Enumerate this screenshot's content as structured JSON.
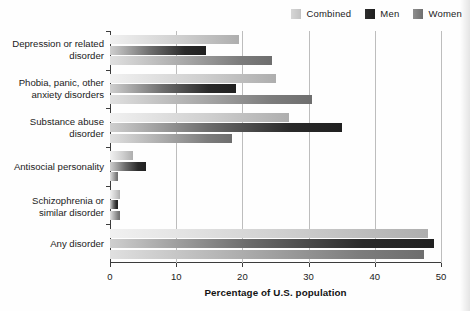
{
  "chart_data": {
    "type": "bar",
    "orientation": "horizontal",
    "title": "",
    "xlabel": "Percentage of U.S. population",
    "ylabel": "",
    "xlim": [
      0,
      50
    ],
    "xticks": [
      0,
      10,
      20,
      30,
      40,
      50
    ],
    "grid": "vertical",
    "legend_position": "top-right",
    "categories": [
      "Depression or related disorder",
      "Phobia, panic, other anxiety disorders",
      "Substance abuse disorder",
      "Antisocial personality",
      "Schizophrenia or similar disorder",
      "Any disorder"
    ],
    "series": [
      {
        "name": "Combined",
        "color": "#cfcfcf",
        "values": [
          19.5,
          25.0,
          27.0,
          3.5,
          1.5,
          48.0
        ]
      },
      {
        "name": "Men",
        "color": "#232323",
        "values": [
          14.5,
          19.0,
          35.0,
          5.5,
          1.2,
          49.0
        ]
      },
      {
        "name": "Women",
        "color": "#7e7e7e",
        "values": [
          24.5,
          30.5,
          18.5,
          1.2,
          1.5,
          47.5
        ]
      }
    ]
  },
  "legend": {
    "entries": [
      {
        "label": "Combined"
      },
      {
        "label": "Men"
      },
      {
        "label": "Women"
      }
    ]
  },
  "axis": {
    "x_title": "Percentage of U.S. population",
    "tick_labels": [
      "0",
      "10",
      "20",
      "30",
      "40",
      "50"
    ]
  },
  "category_labels": [
    {
      "line1": "Depression or related",
      "line2": "disorder"
    },
    {
      "line1": "Phobia, panic, other",
      "line2": "anxiety disorders"
    },
    {
      "line1": "Substance abuse",
      "line2": "disorder"
    },
    {
      "line1": "Antisocial personality",
      "line2": ""
    },
    {
      "line1": "Schizophrenia or",
      "line2": "similar disorder"
    },
    {
      "line1": "Any disorder",
      "line2": ""
    }
  ]
}
